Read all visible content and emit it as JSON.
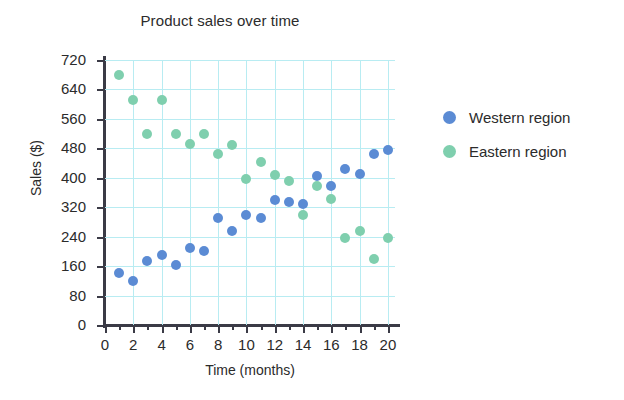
{
  "chart_data": {
    "type": "scatter",
    "title": "Product sales over time",
    "xlabel": "Time (months)",
    "ylabel": "Sales ($)",
    "xlim": [
      0,
      20.5
    ],
    "ylim": [
      0,
      720
    ],
    "grid": true,
    "grid_color": "#b8ecf2",
    "legend_position": "right",
    "xticks": [
      0,
      2,
      4,
      6,
      8,
      10,
      12,
      14,
      16,
      18,
      20
    ],
    "xtick_labels": [
      "0",
      "2",
      "4",
      "6",
      "8",
      "10",
      "12",
      "14",
      "16",
      "18",
      "20"
    ],
    "x_minor_ticks": [
      1,
      3,
      5,
      7,
      9,
      11,
      13,
      15,
      17,
      19
    ],
    "yticks": [
      0,
      80,
      160,
      240,
      320,
      400,
      480,
      560,
      640,
      720
    ],
    "ytick_labels": [
      "0",
      "80",
      "160",
      "240",
      "320",
      "400",
      "480",
      "560",
      "640",
      "720"
    ],
    "series": [
      {
        "name": "Western region",
        "color": "#5b8bd4",
        "x": [
          1,
          2,
          3,
          4,
          5,
          6,
          7,
          8,
          9,
          10,
          11,
          12,
          13,
          14,
          15,
          16,
          17,
          18,
          19,
          20
        ],
        "y": [
          140,
          120,
          175,
          190,
          162,
          210,
          200,
          290,
          255,
          300,
          290,
          340,
          333,
          330,
          405,
          378,
          425,
          410,
          465,
          475
        ]
      },
      {
        "name": "Eastern region",
        "color": "#7fcfae",
        "x": [
          1,
          2,
          3,
          4,
          5,
          6,
          7,
          8,
          9,
          10,
          11,
          12,
          13,
          14,
          15,
          16,
          17,
          18,
          19,
          20
        ],
        "y": [
          680,
          612,
          518,
          610,
          520,
          492,
          518,
          465,
          490,
          398,
          443,
          408,
          392,
          300,
          378,
          342,
          237,
          255,
          180,
          237
        ]
      }
    ]
  },
  "legend": {
    "items": [
      {
        "label": "Western region",
        "color": "#5b8bd4"
      },
      {
        "label": "Eastern region",
        "color": "#7fcfae"
      }
    ]
  }
}
